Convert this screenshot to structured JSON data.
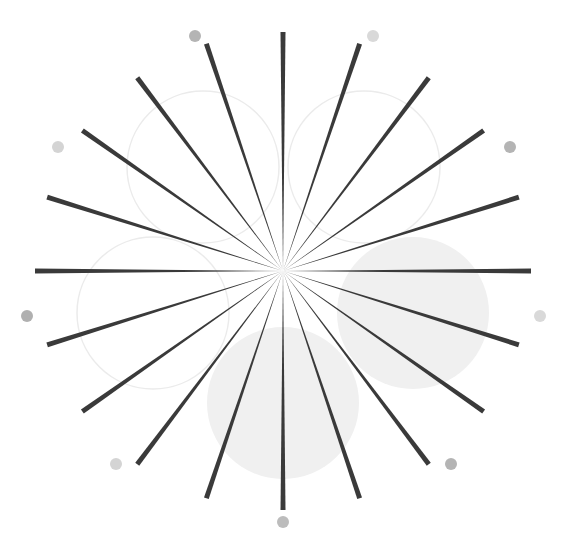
{
  "figure": {
    "width": 563,
    "height": 540,
    "background": "#ffffff",
    "center": {
      "x": 283,
      "y": 271
    },
    "spokes": {
      "count": 20,
      "angle_step_deg": 18,
      "start_angle_deg": 0,
      "outer_rx": 248,
      "outer_ry": 239,
      "outer_width": 5,
      "color": "#3a3a3a"
    },
    "circles": [
      {
        "name": "top-left-outline-circle",
        "cx": 203,
        "cy": 167,
        "r": 76,
        "fill": "none",
        "stroke": "#ebebeb"
      },
      {
        "name": "top-right-outline-circle",
        "cx": 364,
        "cy": 167,
        "r": 76,
        "fill": "none",
        "stroke": "#ebebeb"
      },
      {
        "name": "left-outline-circle",
        "cx": 153,
        "cy": 313,
        "r": 76,
        "fill": "none",
        "stroke": "#ebebeb"
      },
      {
        "name": "right-filled-circle",
        "cx": 413,
        "cy": 313,
        "r": 76,
        "fill": "#f0f0f0",
        "stroke": "none"
      },
      {
        "name": "bottom-filled-circle",
        "cx": 283,
        "cy": 403,
        "r": 76,
        "fill": "#f0f0f0",
        "stroke": "none"
      }
    ],
    "dots": [
      {
        "name": "dot-top-left",
        "cx": 195,
        "cy": 36,
        "r": 6,
        "fill": "#b4b4b4"
      },
      {
        "name": "dot-top-right",
        "cx": 373,
        "cy": 36,
        "r": 6,
        "fill": "#d9d9d9"
      },
      {
        "name": "dot-upper-right",
        "cx": 510,
        "cy": 147,
        "r": 6,
        "fill": "#b4b4b4"
      },
      {
        "name": "dot-upper-left",
        "cx": 58,
        "cy": 147,
        "r": 6,
        "fill": "#d4d4d4"
      },
      {
        "name": "dot-left",
        "cx": 27,
        "cy": 316,
        "r": 6,
        "fill": "#b0b0b0"
      },
      {
        "name": "dot-right",
        "cx": 540,
        "cy": 316,
        "r": 6,
        "fill": "#d9d9d9"
      },
      {
        "name": "dot-lower-left",
        "cx": 116,
        "cy": 464,
        "r": 6,
        "fill": "#d4d4d4"
      },
      {
        "name": "dot-lower-right",
        "cx": 451,
        "cy": 464,
        "r": 6,
        "fill": "#b4b4b4"
      },
      {
        "name": "dot-bottom",
        "cx": 283,
        "cy": 522,
        "r": 6,
        "fill": "#bcbcbc"
      }
    ]
  }
}
